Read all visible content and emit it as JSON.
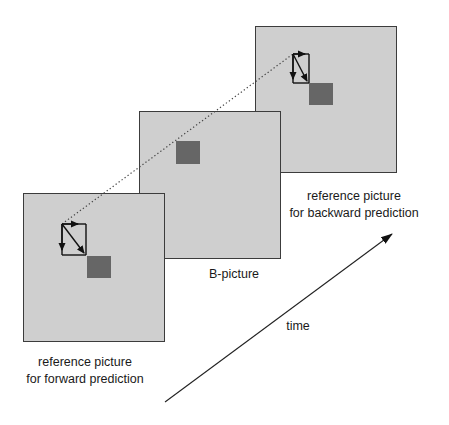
{
  "diagram": {
    "title": "",
    "panels": {
      "backward": {
        "caption_line1": "reference picture",
        "caption_line2": "for backward prediction"
      },
      "b_picture": {
        "caption": "B-picture"
      },
      "forward": {
        "caption_line1": "reference picture",
        "caption_line2": "for forward prediction"
      }
    },
    "time_axis": {
      "label": "time"
    }
  },
  "colors": {
    "panel_fill": "#cfcfcf",
    "panel_border": "#3c3c3c",
    "macroblock": "#666666",
    "arrows": "#111111",
    "background": "#ffffff"
  }
}
